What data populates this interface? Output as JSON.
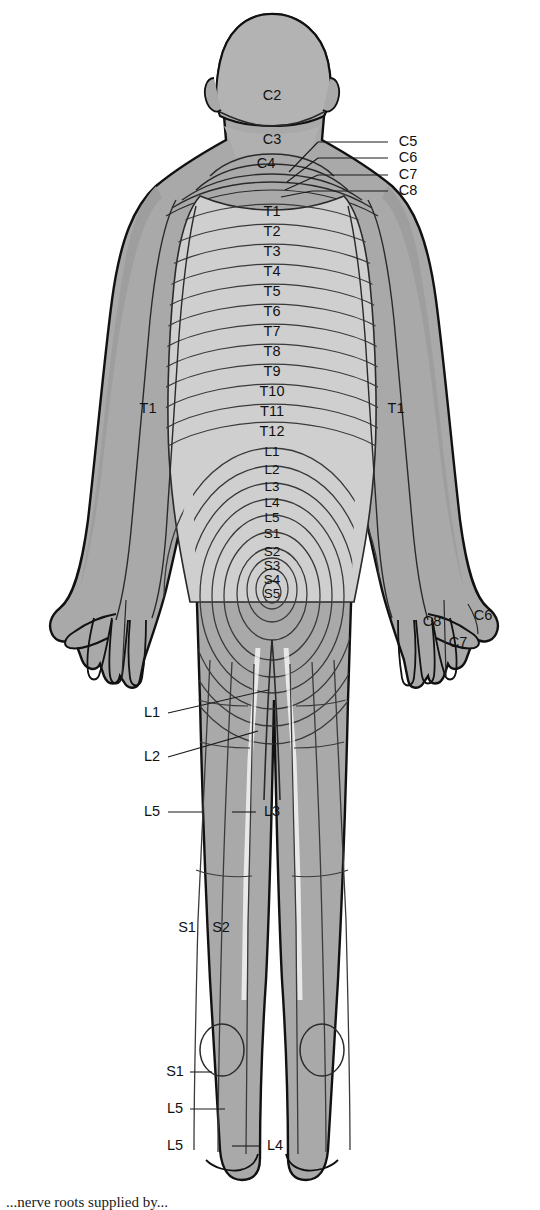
{
  "figure": {
    "view": "posterior",
    "caption_partial": "...nerve roots supplied by..."
  },
  "colors": {
    "background": "#ffffff",
    "skin_dark": "#a9a9a9",
    "skin_mid": "#b9b9b9",
    "skin_light": "#cfcfcf",
    "outline": "#111111",
    "band_line": "#3a3a3a",
    "label_text": "#111111",
    "leader_line": "#1a1a1a"
  },
  "labels": {
    "head_neck": [
      {
        "id": "C2",
        "text": "C2",
        "x": 272,
        "y": 96
      },
      {
        "id": "C3",
        "text": "C3",
        "x": 272,
        "y": 140
      },
      {
        "id": "C4",
        "text": "C4",
        "x": 266,
        "y": 164
      }
    ],
    "cervical_callouts": [
      {
        "id": "C5",
        "text": "C5",
        "x": 408,
        "y": 142,
        "leader_from_x": 388,
        "leader_from_y": 142,
        "leader_to_x": 318,
        "leader_to_y": 142,
        "tip_x": 289,
        "tip_y": 172
      },
      {
        "id": "C6",
        "text": "C6",
        "x": 408,
        "y": 158,
        "leader_from_x": 388,
        "leader_from_y": 158,
        "leader_to_x": 318,
        "leader_to_y": 158,
        "tip_x": 287,
        "tip_y": 182
      },
      {
        "id": "C7",
        "text": "C7",
        "x": 408,
        "y": 175,
        "leader_from_x": 388,
        "leader_from_y": 175,
        "leader_to_x": 318,
        "leader_to_y": 175,
        "tip_x": 285,
        "tip_y": 190
      },
      {
        "id": "C8",
        "text": "C8",
        "x": 408,
        "y": 191,
        "leader_from_x": 388,
        "leader_from_y": 191,
        "leader_to_x": 312,
        "leader_to_y": 191,
        "tip_x": 281,
        "tip_y": 197
      }
    ],
    "thoracic": [
      {
        "id": "T1",
        "text": "T1",
        "x": 272,
        "y": 212
      },
      {
        "id": "T2",
        "text": "T2",
        "x": 272,
        "y": 232
      },
      {
        "id": "T3",
        "text": "T3",
        "x": 272,
        "y": 252
      },
      {
        "id": "T4",
        "text": "T4",
        "x": 272,
        "y": 272
      },
      {
        "id": "T5",
        "text": "T5",
        "x": 272,
        "y": 292
      },
      {
        "id": "T6",
        "text": "T6",
        "x": 272,
        "y": 312
      },
      {
        "id": "T7",
        "text": "T7",
        "x": 272,
        "y": 332
      },
      {
        "id": "T8",
        "text": "T8",
        "x": 272,
        "y": 352
      },
      {
        "id": "T9",
        "text": "T9",
        "x": 272,
        "y": 372
      },
      {
        "id": "T10",
        "text": "T10",
        "x": 272,
        "y": 392
      },
      {
        "id": "T11",
        "text": "T11",
        "x": 272,
        "y": 412
      },
      {
        "id": "T12",
        "text": "T12",
        "x": 272,
        "y": 432
      }
    ],
    "lumbosacral_rings": [
      {
        "id": "L1",
        "text": "L1",
        "x": 272,
        "y": 452
      },
      {
        "id": "L2",
        "text": "L2",
        "x": 272,
        "y": 470
      },
      {
        "id": "L3",
        "text": "L3",
        "x": 272,
        "y": 487
      },
      {
        "id": "L4",
        "text": "L4",
        "x": 272,
        "y": 503
      },
      {
        "id": "L5",
        "text": "L5",
        "x": 272,
        "y": 518
      },
      {
        "id": "S1",
        "text": "S1",
        "x": 272,
        "y": 534
      },
      {
        "id": "S2",
        "text": "S2",
        "x": 272,
        "y": 552
      },
      {
        "id": "S3",
        "text": "S3",
        "x": 272,
        "y": 566
      },
      {
        "id": "S4",
        "text": "S4",
        "x": 272,
        "y": 580
      },
      {
        "id": "S5",
        "text": "S5",
        "x": 272,
        "y": 594
      }
    ],
    "arms": [
      {
        "id": "T1-left-arm",
        "text": "T1",
        "x": 148,
        "y": 409
      },
      {
        "id": "T1-right-arm",
        "text": "T1",
        "x": 396,
        "y": 409
      }
    ],
    "right_hand": [
      {
        "id": "C8-hand",
        "text": "C8",
        "x": 432,
        "y": 622
      },
      {
        "id": "C7-hand",
        "text": "C7",
        "x": 458,
        "y": 643
      },
      {
        "id": "C6-hand",
        "text": "C6",
        "x": 483,
        "y": 616
      }
    ],
    "legs_callouts": [
      {
        "id": "L1-leg",
        "text": "L1",
        "x": 152,
        "y": 713,
        "leader_from_x": 168,
        "leader_from_y": 713,
        "leader_to_x": 268,
        "leader_to_y": 690
      },
      {
        "id": "L2-leg",
        "text": "L2",
        "x": 152,
        "y": 757,
        "leader_from_x": 168,
        "leader_from_y": 757,
        "leader_to_x": 258,
        "leader_to_y": 731
      },
      {
        "id": "L5-thigh",
        "text": "L5",
        "x": 152,
        "y": 812,
        "leader_from_x": 168,
        "leader_from_y": 812,
        "leader_to_x": 204,
        "leader_to_y": 812
      },
      {
        "id": "L3-thigh",
        "text": "L3",
        "x": 272,
        "y": 812,
        "leader_from_x": 256,
        "leader_from_y": 812,
        "leader_to_x": 232,
        "leader_to_y": 812
      }
    ],
    "calf": [
      {
        "id": "S1-calf",
        "text": "S1",
        "x": 187,
        "y": 928
      },
      {
        "id": "S2-calf",
        "text": "S2",
        "x": 221,
        "y": 928
      }
    ],
    "foot_callouts": [
      {
        "id": "S1-foot",
        "text": "S1",
        "x": 175,
        "y": 1072,
        "leader_from_x": 190,
        "leader_from_y": 1072,
        "leader_to_x": 212,
        "leader_to_y": 1072
      },
      {
        "id": "L5-foot",
        "text": "L5",
        "x": 175,
        "y": 1109,
        "leader_from_x": 190,
        "leader_from_y": 1109,
        "leader_to_x": 225,
        "leader_to_y": 1109
      },
      {
        "id": "L5-toe",
        "text": "L5",
        "x": 175,
        "y": 1146,
        "leader_from_x": null,
        "leader_from_y": null,
        "leader_to_x": null,
        "leader_to_y": null
      },
      {
        "id": "L4-foot",
        "text": "L4",
        "x": 275,
        "y": 1146,
        "leader_from_x": 259,
        "leader_from_y": 1146,
        "leader_to_x": 232,
        "leader_to_y": 1146
      }
    ]
  }
}
